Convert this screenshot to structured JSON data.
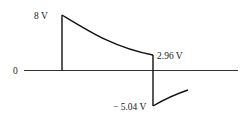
{
  "figure": {
    "type": "voltage waveform",
    "labels": {
      "peak": "8 V",
      "zero": "0",
      "end_positive": "2.96 V",
      "end_negative": "− 5.04 V"
    },
    "colors": {
      "line": "#111111",
      "axis": "#333333",
      "text": "#222222"
    }
  }
}
